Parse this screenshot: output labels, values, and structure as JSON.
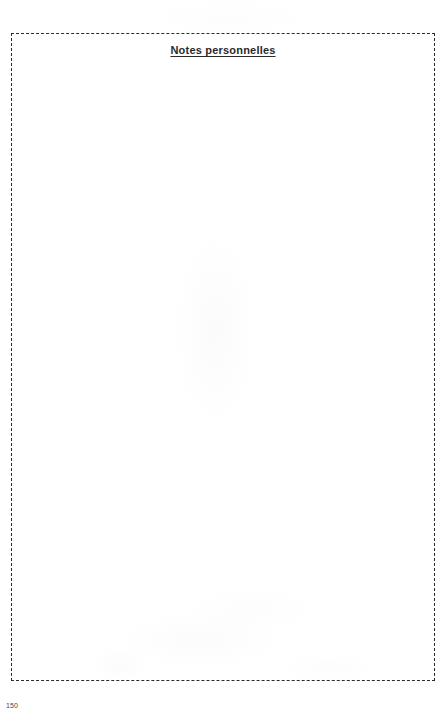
{
  "page": {
    "background_color": "#ffffff",
    "width": 448,
    "height": 717
  },
  "note_frame": {
    "title": "Notes personnelles",
    "border_color": "#2c2c2c",
    "border_style": "dashed",
    "body_text": ""
  },
  "footer": {
    "page_number": "150",
    "color": "#4a4a4a"
  }
}
